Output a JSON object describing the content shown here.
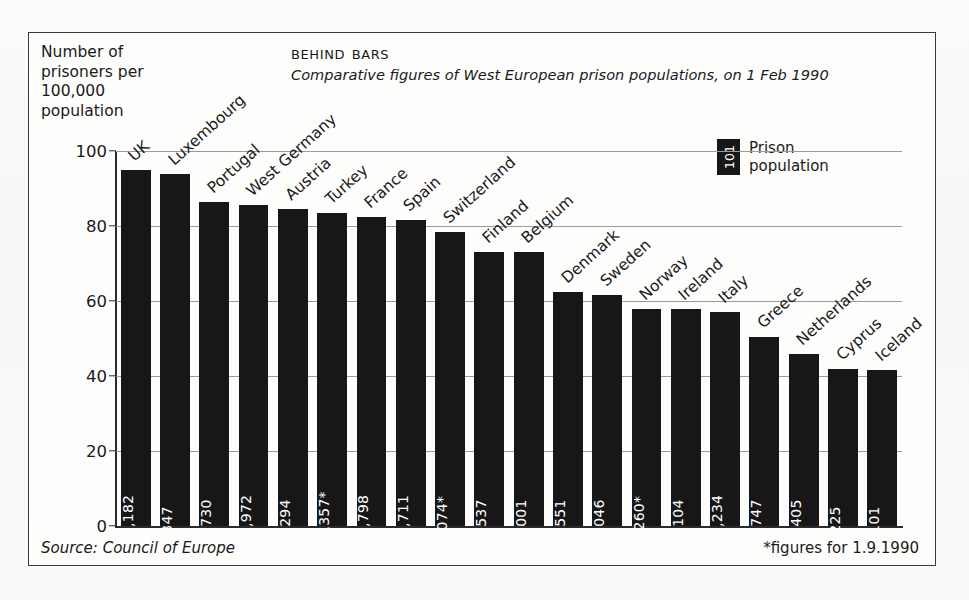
{
  "header": {
    "axis_caption": "Number of\nprisoners per\n100,000\npopulation",
    "title": "Behind Bars",
    "subtitle": "Comparative figures of West European prison populations, on 1 Feb 1990"
  },
  "legend": {
    "swatch_value": "101",
    "label": "Prison\npopulation"
  },
  "footer": {
    "source": "Source: Council of Europe",
    "note": "*figures for 1.9.1990"
  },
  "colors": {
    "bar": "#17171a",
    "frame": "#3a3a3a",
    "grid": "#9b9b9b",
    "text": "#1a1a1a",
    "bar_label": "#ffffff"
  },
  "chart_data": {
    "type": "bar",
    "title": "Behind Bars",
    "subtitle": "Comparative figures of West European prison populations, on 1 Feb 1990",
    "xlabel": "",
    "ylabel": "Number of prisoners per 100,000 population",
    "ylim": [
      0,
      100
    ],
    "yticks": [
      0,
      20,
      40,
      60,
      80,
      100
    ],
    "ytick_labels": [
      "0",
      "20",
      "40",
      "60",
      "80",
      "100"
    ],
    "grid": true,
    "legend_position": "top-right",
    "series_name": "Prison population",
    "categories": [
      "UK",
      "Luxembourg",
      "Portugal",
      "West Germany",
      "Austria",
      "Turkey",
      "France",
      "Spain",
      "Switzerland",
      "Finland",
      "Belgium",
      "Denmark",
      "Sweden",
      "Norway",
      "Ireland",
      "Italy",
      "Greece",
      "Netherlands",
      "Cyprus",
      "Iceland"
    ],
    "values": [
      95,
      94,
      86.5,
      85.5,
      84.5,
      83.5,
      82.5,
      81.5,
      78.5,
      73,
      73,
      62.5,
      61.5,
      58,
      58,
      57,
      50.5,
      46,
      42,
      41.5
    ],
    "bar_labels": [
      "53,182",
      "347",
      "8,730",
      "51,972",
      "6,294",
      "46,357*",
      "46,798",
      "31,711",
      "5,074*",
      "3,537",
      "7,001",
      "3,551",
      "5,046",
      "2,260*",
      "2,104",
      "31,234",
      "4,747",
      "6,405",
      "225",
      "101"
    ],
    "points": [
      {
        "category": "UK",
        "rate_per_100k": 95,
        "prison_population": "53,182"
      },
      {
        "category": "Luxembourg",
        "rate_per_100k": 94,
        "prison_population": "347"
      },
      {
        "category": "Portugal",
        "rate_per_100k": 86.5,
        "prison_population": "8,730"
      },
      {
        "category": "West Germany",
        "rate_per_100k": 85.5,
        "prison_population": "51,972"
      },
      {
        "category": "Austria",
        "rate_per_100k": 84.5,
        "prison_population": "6,294"
      },
      {
        "category": "Turkey",
        "rate_per_100k": 83.5,
        "prison_population": "46,357*"
      },
      {
        "category": "France",
        "rate_per_100k": 82.5,
        "prison_population": "46,798"
      },
      {
        "category": "Spain",
        "rate_per_100k": 81.5,
        "prison_population": "31,711"
      },
      {
        "category": "Switzerland",
        "rate_per_100k": 78.5,
        "prison_population": "5,074*"
      },
      {
        "category": "Finland",
        "rate_per_100k": 73,
        "prison_population": "3,537"
      },
      {
        "category": "Belgium",
        "rate_per_100k": 73,
        "prison_population": "7,001"
      },
      {
        "category": "Denmark",
        "rate_per_100k": 62.5,
        "prison_population": "3,551"
      },
      {
        "category": "Sweden",
        "rate_per_100k": 61.5,
        "prison_population": "5,046"
      },
      {
        "category": "Norway",
        "rate_per_100k": 58,
        "prison_population": "2,260*"
      },
      {
        "category": "Ireland",
        "rate_per_100k": 58,
        "prison_population": "2,104"
      },
      {
        "category": "Italy",
        "rate_per_100k": 57,
        "prison_population": "31,234"
      },
      {
        "category": "Greece",
        "rate_per_100k": 50.5,
        "prison_population": "4,747"
      },
      {
        "category": "Netherlands",
        "rate_per_100k": 46,
        "prison_population": "6,405"
      },
      {
        "category": "Cyprus",
        "rate_per_100k": 42,
        "prison_population": "225"
      },
      {
        "category": "Iceland",
        "rate_per_100k": 41.5,
        "prison_population": "101"
      }
    ],
    "source": "Council of Europe",
    "annotation": "*figures for 1.9.1990"
  }
}
